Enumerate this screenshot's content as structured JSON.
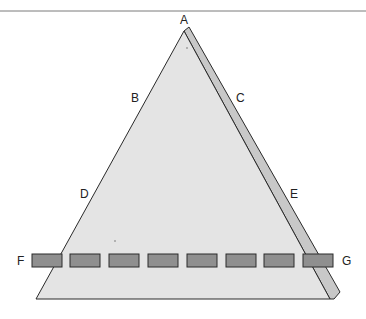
{
  "colors": {
    "face": "#e4e4e4",
    "side": "#c8c8c8",
    "stroke": "#2a2a2a",
    "block": "#8f8f8f",
    "rule": "#7a7a7a"
  },
  "labels": {
    "A": "A",
    "B": "B",
    "C": "C",
    "D": "D",
    "E": "E",
    "F": "F",
    "G": "G"
  },
  "blocks": {
    "count": 8,
    "y": 254,
    "height": 13,
    "width": 30,
    "x": [
      32,
      70,
      109,
      148,
      187,
      226,
      264,
      303
    ]
  }
}
